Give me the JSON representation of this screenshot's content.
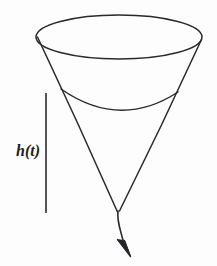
{
  "figure": {
    "background_color": "#fdfdfd",
    "ink_color": "#2a2a2e",
    "width": 217,
    "height": 266
  },
  "labels": {
    "height_label": "h(t)",
    "height_label_x": 16,
    "height_label_y": 143
  },
  "chart_data": {
    "type": "diagram",
    "elements": [
      {
        "name": "cone-rim-ellipse",
        "shape": "ellipse",
        "center_x": 119,
        "center_y": 37,
        "radius_x": 83,
        "radius_y": 22
      },
      {
        "name": "cone-left-side",
        "shape": "line",
        "x1": 37,
        "y1": 38,
        "x2": 118,
        "y2": 212
      },
      {
        "name": "cone-right-side",
        "shape": "line",
        "x1": 202,
        "y1": 39,
        "x2": 119,
        "y2": 211
      },
      {
        "name": "liquid-surface-arc",
        "shape": "arc",
        "x1": 61,
        "y1": 89,
        "x2": 178,
        "y2": 92,
        "sag_y": 111
      },
      {
        "name": "height-measure-line",
        "shape": "line",
        "x1": 46,
        "y1": 93,
        "x2": 46,
        "y2": 213
      },
      {
        "name": "outflow-stream",
        "shape": "path",
        "x1": 118,
        "y1": 212,
        "x2": 125,
        "y2": 248
      },
      {
        "name": "outflow-arrowhead",
        "shape": "triangle",
        "tip_x": 128,
        "tip_y": 257
      }
    ],
    "annotations": [
      {
        "text": "h(t)",
        "x": 16,
        "y": 143,
        "meaning": "liquid height as a function of time"
      }
    ]
  }
}
